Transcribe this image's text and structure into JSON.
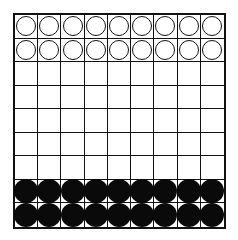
{
  "board": {
    "columns": 9,
    "rows": 9,
    "line_color": "#111111",
    "background_color": "#ffffff",
    "piece_colors": {
      "white": "#ffffff",
      "black": "#0a0a0a"
    },
    "layout": [
      [
        "W",
        "W",
        "W",
        "W",
        "W",
        "W",
        "W",
        "W",
        "W"
      ],
      [
        "W",
        "W",
        "W",
        "W",
        "W",
        "W",
        "W",
        "W",
        "W"
      ],
      [
        "",
        "",
        "",
        "",
        "",
        "",
        "",
        "",
        ""
      ],
      [
        "",
        "",
        "",
        "",
        "",
        "",
        "",
        "",
        ""
      ],
      [
        "",
        "",
        "",
        "",
        "",
        "",
        "",
        "",
        ""
      ],
      [
        "",
        "",
        "",
        "",
        "",
        "",
        "",
        "",
        ""
      ],
      [
        "",
        "",
        "",
        "",
        "",
        "",
        "",
        "",
        ""
      ],
      [
        "B",
        "B",
        "B",
        "B",
        "B",
        "B",
        "B",
        "B",
        "B"
      ],
      [
        "B",
        "B",
        "B",
        "B",
        "B",
        "B",
        "B",
        "B",
        "B"
      ]
    ],
    "piece_counts": {
      "white": 18,
      "black": 18
    }
  }
}
